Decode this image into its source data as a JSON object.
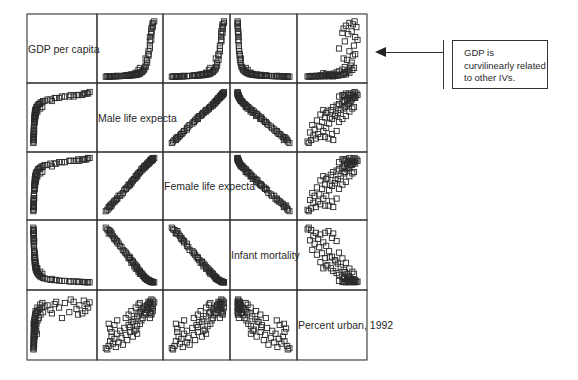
{
  "chart_data": {
    "type": "scatter-matrix",
    "title": "",
    "variables": [
      {
        "key": "gdp",
        "label": "GDP per capita",
        "lim": [
          0,
          20000
        ]
      },
      {
        "key": "male_le",
        "label": "Male life expectancy",
        "lim": [
          40,
          78
        ]
      },
      {
        "key": "female_le",
        "label": "Female life expectancy",
        "lim": [
          42,
          82
        ]
      },
      {
        "key": "infant_mort",
        "label": "Infant mortality",
        "lim": [
          0,
          170
        ]
      },
      {
        "key": "urban",
        "label": "Percent urban, 1992",
        "lim": [
          0,
          100
        ]
      }
    ],
    "diagonal_labels": [
      "GDP per capita",
      "Male life expecta",
      "Female life expecta",
      "Infant mortality",
      "Percent urban, 1992"
    ],
    "marker": "open-square",
    "grid": true,
    "observations": [
      [
        120,
        42,
        44,
        165,
        10
      ],
      [
        150,
        44,
        46,
        158,
        14
      ],
      [
        180,
        45,
        47,
        150,
        22
      ],
      [
        200,
        43,
        45,
        160,
        8
      ],
      [
        210,
        46,
        49,
        145,
        30
      ],
      [
        230,
        47,
        50,
        140,
        18
      ],
      [
        250,
        48,
        51,
        132,
        26
      ],
      [
        260,
        49,
        52,
        128,
        12
      ],
      [
        280,
        50,
        53,
        122,
        35
      ],
      [
        300,
        51,
        55,
        118,
        20
      ],
      [
        320,
        52,
        55,
        112,
        40
      ],
      [
        350,
        53,
        56,
        108,
        28
      ],
      [
        380,
        54,
        57,
        100,
        16
      ],
      [
        400,
        55,
        59,
        96,
        45
      ],
      [
        420,
        56,
        60,
        90,
        33
      ],
      [
        450,
        57,
        61,
        86,
        24
      ],
      [
        480,
        58,
        62,
        80,
        50
      ],
      [
        500,
        59,
        63,
        76,
        38
      ],
      [
        550,
        60,
        64,
        70,
        55
      ],
      [
        600,
        61,
        66,
        64,
        30
      ],
      [
        650,
        62,
        67,
        60,
        60
      ],
      [
        700,
        63,
        68,
        55,
        42
      ],
      [
        800,
        64,
        69,
        50,
        65
      ],
      [
        900,
        64,
        70,
        46,
        48
      ],
      [
        1000,
        65,
        71,
        42,
        70
      ],
      [
        1200,
        66,
        72,
        38,
        52
      ],
      [
        1400,
        66,
        72,
        35,
        72
      ],
      [
        1600,
        67,
        73,
        32,
        58
      ],
      [
        1800,
        67,
        74,
        30,
        75
      ],
      [
        2000,
        68,
        74,
        27,
        62
      ],
      [
        2300,
        68,
        75,
        24,
        78
      ],
      [
        2600,
        69,
        75,
        22,
        68
      ],
      [
        3000,
        69,
        76,
        20,
        80
      ],
      [
        3500,
        70,
        76,
        18,
        72
      ],
      [
        4000,
        70,
        77,
        16,
        82
      ],
      [
        1500,
        63,
        69,
        45,
        80
      ],
      [
        2500,
        65,
        71,
        36,
        85
      ],
      [
        3200,
        66,
        72,
        30,
        88
      ],
      [
        700,
        58,
        63,
        75,
        68
      ],
      [
        900,
        60,
        65,
        62,
        74
      ],
      [
        5000,
        71,
        77,
        14,
        84
      ],
      [
        6000,
        71,
        78,
        12,
        76
      ],
      [
        7500,
        72,
        78,
        11,
        86
      ],
      [
        9000,
        72,
        79,
        10,
        80
      ],
      [
        11000,
        73,
        79,
        9,
        88
      ],
      [
        12500,
        73,
        80,
        8,
        72
      ],
      [
        14000,
        73,
        80,
        8,
        90
      ],
      [
        15000,
        74,
        80,
        7,
        78
      ],
      [
        16000,
        74,
        80,
        7,
        84
      ],
      [
        17000,
        74,
        81,
        6,
        70
      ],
      [
        17500,
        75,
        81,
        6,
        92
      ],
      [
        18000,
        75,
        81,
        5,
        74
      ],
      [
        18500,
        75,
        81,
        6,
        86
      ],
      [
        19000,
        75,
        82,
        5,
        80
      ],
      [
        19500,
        76,
        82,
        5,
        89
      ],
      [
        13000,
        74,
        80,
        7,
        94
      ],
      [
        15500,
        74,
        81,
        6,
        68
      ],
      [
        10000,
        73,
        79,
        9,
        62
      ],
      [
        8000,
        72,
        78,
        12,
        90
      ],
      [
        6500,
        70,
        76,
        15,
        70
      ],
      [
        300,
        46,
        48,
        150,
        38
      ],
      [
        260,
        45,
        48,
        155,
        44
      ],
      [
        350,
        48,
        51,
        135,
        50
      ],
      [
        420,
        50,
        53,
        126,
        58
      ],
      [
        200,
        44,
        47,
        148,
        52
      ],
      [
        1100,
        62,
        67,
        52,
        40
      ],
      [
        1300,
        64,
        69,
        46,
        35
      ],
      [
        600,
        56,
        60,
        92,
        62
      ],
      [
        750,
        59,
        63,
        78,
        46
      ],
      [
        850,
        61,
        66,
        66,
        56
      ]
    ]
  },
  "annotation": {
    "lines": [
      "GDP is",
      "curvilinearly related",
      "to other IVs."
    ],
    "points_to": "GDP per capita row"
  }
}
